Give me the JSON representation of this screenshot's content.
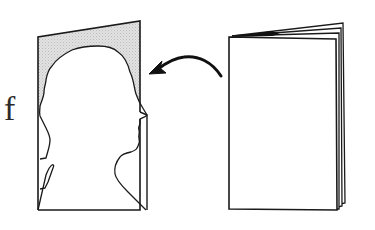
{
  "diagram": {
    "fragment_text": "f",
    "elements": [
      {
        "id": "silhouette-card",
        "description": "Folded card with a human head-and-shoulders profile silhouette cut out; background of the card shaded grey"
      },
      {
        "id": "arrow",
        "description": "Curved arrow pointing from the booklet toward the silhouette card"
      },
      {
        "id": "booklet",
        "description": "Closed booklet with several stacked pages, viewed at a slight angle"
      }
    ],
    "colors": {
      "line": "#1a1a1a",
      "shade": "#d9d9d9",
      "background": "#ffffff",
      "paper": "#ffffff"
    }
  }
}
